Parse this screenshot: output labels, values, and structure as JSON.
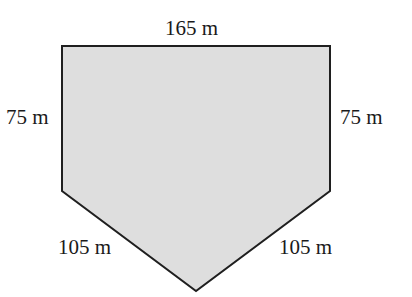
{
  "diagram": {
    "shape": "pentagon",
    "fill": "#dedede",
    "stroke": "#1f1f1f",
    "labels": {
      "top": "165 m",
      "left": "75 m",
      "right": "75 m",
      "bottom_left": "105 m",
      "bottom_right": "105 m"
    }
  }
}
